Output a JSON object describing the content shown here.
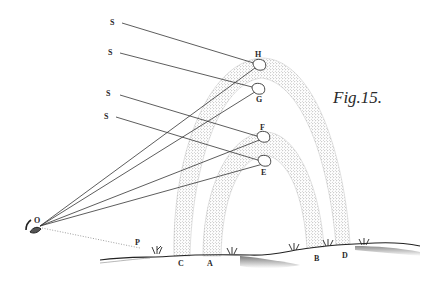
{
  "figure": {
    "title": "Fig.15."
  },
  "labels": {
    "sun_rays": [
      "S",
      "S",
      "S",
      "S"
    ],
    "drops": {
      "H": "H",
      "G": "G",
      "F": "F",
      "E": "E"
    },
    "observer": "O",
    "horizon_point": "P",
    "ground": {
      "C": "C",
      "A": "A",
      "B": "B",
      "D": "D"
    }
  },
  "colors": {
    "ink": "#333333",
    "stipple": "#6a6a6a",
    "background": "#ffffff"
  }
}
